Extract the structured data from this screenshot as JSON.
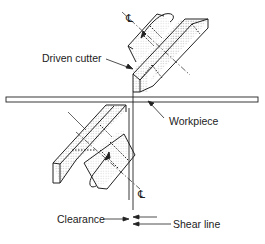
{
  "diagram": {
    "type": "shearing-cutter-schematic",
    "labels": {
      "driven_cutter": "Driven cutter",
      "workpiece": "Workpiece",
      "clearance": "Clearance",
      "shear_line": "Shear line",
      "centerline_top": "℄",
      "centerline_bottom": "℄"
    },
    "colors": {
      "line": "#222222",
      "stipple": "#9a9a9a",
      "background": "#ffffff"
    }
  }
}
